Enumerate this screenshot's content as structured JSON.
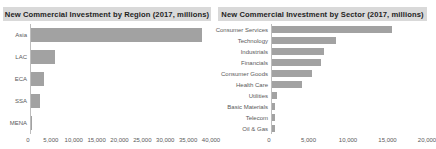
{
  "colors": {
    "bar_fill": "#a2a2a2",
    "title_strip_bg": "#d9d9d9",
    "title_text": "#1f1f1f",
    "label_text": "#595959",
    "axis_line": "#bdbdbd",
    "background": "#ffffff"
  },
  "chart_data": [
    {
      "type": "bar",
      "orientation": "horizontal",
      "title": "New Commercial Investment by Region (2017, millions)",
      "categories": [
        "Asia",
        "LAC",
        "ECA",
        "SSA",
        "MENA"
      ],
      "values": [
        38000,
        5300,
        2800,
        1900,
        200
      ],
      "xlabel": "",
      "ylabel": "",
      "xlim": [
        0,
        40000
      ],
      "xticks": [
        "0",
        "5,000",
        "10,000",
        "15,000",
        "20,000",
        "25,000",
        "30,000",
        "35,000",
        "40,000"
      ],
      "xtick_values": [
        0,
        5000,
        10000,
        15000,
        20000,
        25000,
        30000,
        35000,
        40000
      ],
      "grid": false,
      "legend": "none"
    },
    {
      "type": "bar",
      "orientation": "horizontal",
      "title": "New Commercial Investment by Sector (2017, millions)",
      "categories": [
        "Consumer Services",
        "Technology",
        "Industrials",
        "Financials",
        "Consumer Goods",
        "Health Care",
        "Utilities",
        "Basic Materials",
        "Telecom",
        "Oil & Gas"
      ],
      "values": [
        15500,
        8200,
        6700,
        6300,
        5200,
        3900,
        700,
        400,
        400,
        400
      ],
      "xlabel": "",
      "ylabel": "",
      "xlim": [
        0,
        20000
      ],
      "xticks": [
        "0",
        "5,000",
        "10,000",
        "15,000",
        "20,000"
      ],
      "xtick_values": [
        0,
        5000,
        10000,
        15000,
        20000
      ],
      "grid": false,
      "legend": "none"
    }
  ]
}
